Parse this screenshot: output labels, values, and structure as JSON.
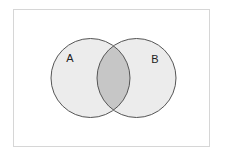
{
  "diagram": {
    "type": "venn",
    "sets": [
      {
        "id": "A",
        "label": "A"
      },
      {
        "id": "B",
        "label": "B"
      }
    ],
    "highlighted_region": "A ∩ B",
    "colors": {
      "background": "#ffffff",
      "frame_border": "#d6d6d6",
      "circle_fill": "#ececec",
      "intersection_fill": "#c6c6c6",
      "circle_stroke": "#555555",
      "label_color": "#222222"
    }
  }
}
